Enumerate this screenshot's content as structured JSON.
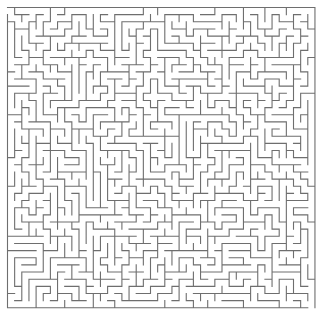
{
  "maze": {
    "cols": 43,
    "rows": 42,
    "cell_size": 7.15,
    "origin_x": 7.5,
    "origin_y": 7.5,
    "seed": 90210,
    "entrance": {
      "side": "left",
      "row": 0
    },
    "exit": {
      "side": "bottom",
      "col": 42
    },
    "colors": {
      "background": "#ffffff",
      "wall": "#6e6e6e"
    },
    "line_width": 1.1
  }
}
